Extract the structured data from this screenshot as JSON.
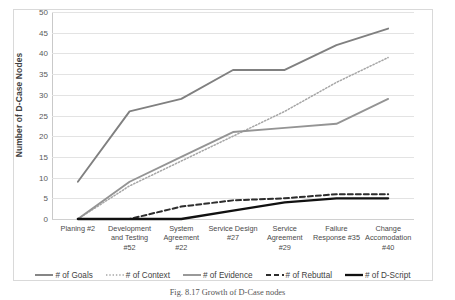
{
  "caption": "Fig. 8.17 Growth of D-Case nodes",
  "axis": {
    "ylabel": "Number of D-Case Nodes",
    "yticks": [
      0,
      5,
      10,
      15,
      20,
      25,
      30,
      35,
      40,
      45,
      50
    ]
  },
  "colors": {
    "goals": "#808080",
    "context": "#a6a6a6",
    "evidence": "#949494",
    "rebuttal": "#2d2d2d",
    "dscript": "#111111",
    "gridline": "#e3e3e3",
    "frame": "#d9d9d9"
  },
  "legend": [
    {
      "label": "# of Goals",
      "style": "solid",
      "color": "#808080",
      "width": 1.9,
      "icon": "line-solid-icon"
    },
    {
      "label": "# of Context",
      "style": "dotted",
      "color": "#a6a6a6",
      "width": 1.5,
      "icon": "line-dotted-icon"
    },
    {
      "label": "# of Evidence",
      "style": "solid",
      "color": "#949494",
      "width": 1.9,
      "icon": "line-solid-icon"
    },
    {
      "label": "# of Rebuttal",
      "style": "dashed",
      "color": "#2d2d2d",
      "width": 1.9,
      "icon": "line-dashed-icon"
    },
    {
      "label": "# of D-Script",
      "style": "solid",
      "color": "#111111",
      "width": 2.3,
      "icon": "line-solid-icon"
    }
  ],
  "chart_data": {
    "type": "line",
    "title": "",
    "xlabel": "",
    "ylabel": "Number of D-Case Nodes",
    "ylim": [
      0,
      50
    ],
    "ytick_step": 5,
    "grid": true,
    "legend_position": "bottom",
    "categories": [
      "Planing #2",
      "Development and Testing #52",
      "System Agreement #22",
      "Service Design #27",
      "Service Agreement #29",
      "Failure Response #35",
      "Change Accomodation #40"
    ],
    "series": [
      {
        "name": "# of Goals",
        "style": "solid",
        "color": "#808080",
        "values": [
          9,
          26,
          29,
          36,
          36,
          42,
          46
        ]
      },
      {
        "name": "# of Context",
        "style": "dotted",
        "color": "#a6a6a6",
        "values": [
          0,
          8,
          14,
          20,
          26,
          33,
          39
        ]
      },
      {
        "name": "# of Evidence",
        "style": "solid",
        "color": "#949494",
        "values": [
          0,
          9,
          15,
          21,
          22,
          23,
          29
        ]
      },
      {
        "name": "# of Rebuttal",
        "style": "dashed",
        "color": "#2d2d2d",
        "values": [
          0,
          0,
          3,
          4.5,
          5,
          6,
          6
        ]
      },
      {
        "name": "# of D-Script",
        "style": "solid",
        "color": "#111111",
        "values": [
          0,
          0,
          0,
          2,
          4,
          5,
          5
        ]
      }
    ]
  }
}
